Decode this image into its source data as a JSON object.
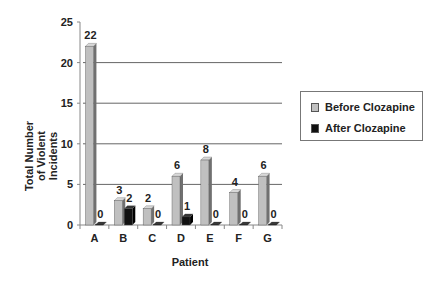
{
  "chart_data": {
    "type": "bar",
    "title": "",
    "xlabel": "Patient",
    "ylabel": "Total Number of Violent Incidents",
    "categories": [
      "A",
      "B",
      "C",
      "D",
      "E",
      "F",
      "G"
    ],
    "series": [
      {
        "name": "Before Clozapine",
        "values": [
          22,
          3,
          2,
          6,
          8,
          4,
          6
        ],
        "color": "#c0c0c0"
      },
      {
        "name": "After Clozapine",
        "values": [
          0,
          2,
          0,
          1,
          0,
          0,
          0
        ],
        "color": "#111111"
      }
    ],
    "ylim": [
      0,
      25
    ],
    "yticks": [
      0,
      5,
      10,
      15,
      20,
      25
    ],
    "grid": true,
    "legend_position": "right",
    "style": "3d-bar"
  },
  "labels": {
    "ytitle_line1": "Total Number",
    "ytitle_line2": "of Violent",
    "ytitle_line3": "Incidents",
    "xtitle": "Patient",
    "legend_before": "Before Clozapine",
    "legend_after": "After Clozapine"
  }
}
